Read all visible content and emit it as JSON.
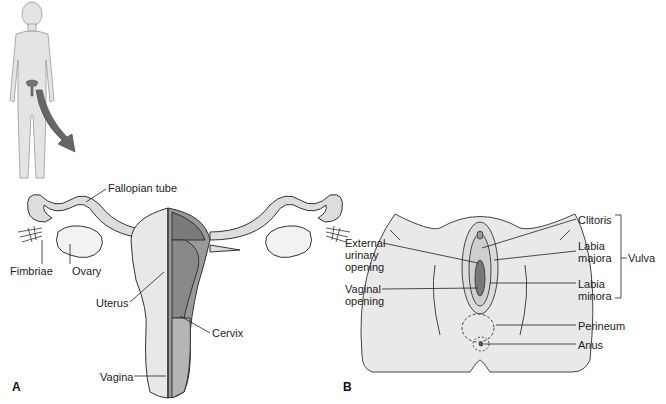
{
  "figure": {
    "panel_a": {
      "letter": "A",
      "labels": {
        "fallopian_tube": "Fallopian tube",
        "fimbriae": "Fimbriae",
        "ovary": "Ovary",
        "uterus": "Uterus",
        "cervix": "Cervix",
        "vagina": "Vagina"
      }
    },
    "panel_b": {
      "letter": "B",
      "labels": {
        "external_urinary_opening": "External\nurinary\nopening",
        "vaginal_opening": "Vaginal\nopening",
        "clitoris": "Clitoris",
        "labia_majora": "Labia\nmajora",
        "labia_minora": "Labia\nminora",
        "vulva": "Vulva",
        "perineum": "Perineum",
        "anus": "Anus"
      }
    },
    "colors": {
      "outline": "#333333",
      "fill_light": "#e6e6e6",
      "fill_dark": "#8a8a8a",
      "arrow": "#666666"
    }
  }
}
